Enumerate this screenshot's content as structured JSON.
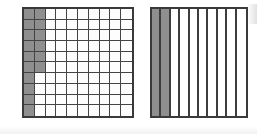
{
  "diagram": {
    "background_color": "#ffffff",
    "shade_color": "#8f8f8f",
    "line_color": "#444444",
    "border_color": "#3a3a3a",
    "figures": [
      {
        "name": "hundredths-grid",
        "type": "grid",
        "columns": 10,
        "rows": 10,
        "total_cells": 100,
        "shaded_cells": 16,
        "fraction_label": "16/100",
        "shading_description": "column 1 shaded in all 10 rows; column 2 shaded in the top 6 rows"
      },
      {
        "name": "tenths-strips",
        "type": "strips",
        "columns": 10,
        "rows": 1,
        "total_cells": 10,
        "shaded_cells": 2,
        "fraction_label": "2/10",
        "shading_description": "first 2 vertical strips shaded full height"
      }
    ]
  },
  "chart_data": {
    "type": "bar",
    "subtitle": "",
    "xlabel": "",
    "ylabel": "",
    "categories": [
      "hundredths-grid",
      "tenths-strips"
    ],
    "values": [
      16,
      2
    ],
    "value_labels": [
      "16 of 100",
      "2 of 10"
    ],
    "fractions": [
      "16/100",
      "2/10"
    ],
    "proportions": [
      0.16,
      0.2
    ],
    "grid": true,
    "legend": "none",
    "ylim": [
      0,
      100
    ]
  }
}
